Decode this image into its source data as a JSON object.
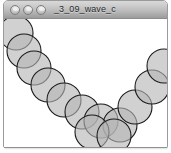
{
  "window": {
    "title": "_3_09_wave_c",
    "controls": [
      {
        "name": "close-button",
        "label": "Close",
        "color": "#cfcfcf"
      },
      {
        "name": "minimize-button",
        "label": "Minimize",
        "color": "#cfcfcf"
      },
      {
        "name": "zoom-button",
        "label": "Zoom",
        "color": "#cfcfcf"
      }
    ],
    "titlebar_color_top": "#d8d8d8",
    "titlebar_color_bottom": "#9b9b9b",
    "border_color": "#9a9a9a"
  },
  "canvas": {
    "background_color": "#ffffff",
    "width": 165,
    "height": 129,
    "frame_color": "#c9c9c9"
  },
  "sketch": {
    "name": "wave-circle-chain",
    "shape_fill": "#b5b5b5",
    "shape_fill_opacity": 0.62,
    "shape_stroke": "#1a1a1a",
    "shape_stroke_width": 1.1,
    "radius": 17,
    "circles": [
      {
        "cx": 12,
        "cy": 14
      },
      {
        "cx": 20,
        "cy": 32
      },
      {
        "cx": 30,
        "cy": 49
      },
      {
        "cx": 44,
        "cy": 66
      },
      {
        "cx": 60,
        "cy": 81
      },
      {
        "cx": 78,
        "cy": 93
      },
      {
        "cx": 97,
        "cy": 102
      },
      {
        "cx": 116,
        "cy": 106
      },
      {
        "cx": 88,
        "cy": 113
      },
      {
        "cx": 110,
        "cy": 117
      },
      {
        "cx": 131,
        "cy": 88
      },
      {
        "cx": 148,
        "cy": 68
      },
      {
        "cx": 160,
        "cy": 47
      }
    ]
  }
}
